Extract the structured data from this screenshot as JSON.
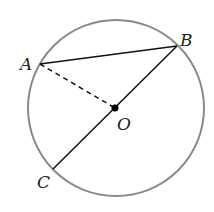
{
  "diagram": {
    "type": "geometry-circle",
    "circle": {
      "cx": 116,
      "cy": 108,
      "r": 88,
      "stroke": "#8a8a8a"
    },
    "points": {
      "A": {
        "x": 40,
        "y": 64,
        "label": "A"
      },
      "B": {
        "x": 177,
        "y": 46,
        "label": "B"
      },
      "C": {
        "x": 53,
        "y": 169,
        "label": "C"
      },
      "O": {
        "x": 115,
        "y": 108,
        "label": "O"
      }
    },
    "segments": [
      {
        "from": "A",
        "to": "B",
        "style": "solid"
      },
      {
        "from": "B",
        "to": "C",
        "style": "solid"
      },
      {
        "from": "A",
        "to": "O",
        "style": "dashed"
      }
    ]
  }
}
